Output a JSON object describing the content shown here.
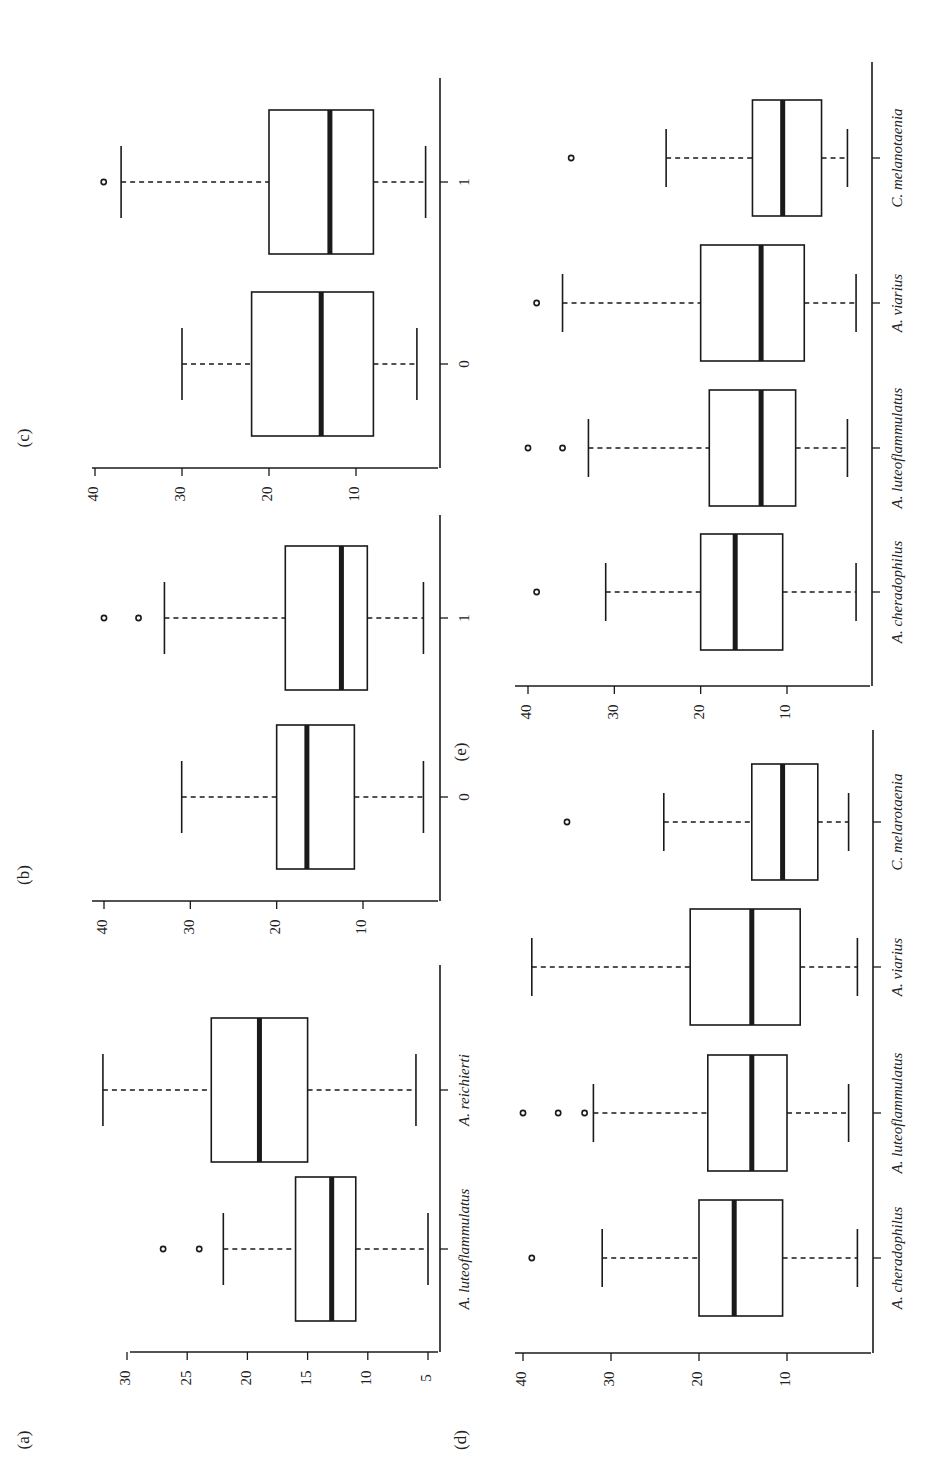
{
  "figure": {
    "orientation": "rotated-90-ccw",
    "colors": {
      "ink": "#1a1a1a",
      "background": "#ffffff"
    }
  },
  "chart_data": [
    {
      "panel": "(a)",
      "type": "box",
      "title": "",
      "xlabel": "",
      "ylabel": "",
      "yticks": [
        5,
        10,
        15,
        20,
        25,
        30
      ],
      "ylim": [
        4,
        32
      ],
      "categories": [
        "A. luteoflammulatus",
        "A. reichierti"
      ],
      "series": [
        {
          "name": "A. luteoflammulatus",
          "whisker_low": 5,
          "q1": 11,
          "median": 13,
          "q3": 16,
          "whisker_high": 22,
          "outliers": [
            24,
            27
          ]
        },
        {
          "name": "A. reichierti",
          "whisker_low": 6,
          "q1": 15,
          "median": 19,
          "q3": 23,
          "whisker_high": 32,
          "outliers": []
        }
      ]
    },
    {
      "panel": "(b)",
      "type": "box",
      "title": "",
      "xlabel": "",
      "ylabel": "",
      "yticks": [
        10,
        20,
        30,
        40
      ],
      "ylim": [
        2,
        41
      ],
      "categories": [
        "0",
        "1"
      ],
      "series": [
        {
          "name": "0",
          "whisker_low": 3,
          "q1": 11,
          "median": 16.5,
          "q3": 20,
          "whisker_high": 31,
          "outliers": []
        },
        {
          "name": "1",
          "whisker_low": 3,
          "q1": 9.5,
          "median": 12.5,
          "q3": 19,
          "whisker_high": 33,
          "outliers": [
            36,
            40
          ]
        }
      ]
    },
    {
      "panel": "(c)",
      "type": "box",
      "title": "",
      "xlabel": "",
      "ylabel": "",
      "yticks": [
        10,
        20,
        30,
        40
      ],
      "ylim": [
        1,
        41
      ],
      "categories": [
        "0",
        "1"
      ],
      "series": [
        {
          "name": "0",
          "whisker_low": 3,
          "q1": 8,
          "median": 14,
          "q3": 22,
          "whisker_high": 30,
          "outliers": []
        },
        {
          "name": "1",
          "whisker_low": 2,
          "q1": 8,
          "median": 13,
          "q3": 20,
          "whisker_high": 37,
          "outliers": [
            39
          ]
        }
      ]
    },
    {
      "panel": "(d)",
      "type": "box",
      "title": "",
      "xlabel": "",
      "ylabel": "",
      "yticks": [
        10,
        20,
        30,
        40
      ],
      "ylim": [
        1,
        41
      ],
      "categories": [
        "A. cheradophilus",
        "A. luteoflammulatus",
        "A. viarius",
        "C. melarotaenia"
      ],
      "series": [
        {
          "name": "A. cheradophilus",
          "whisker_low": 2,
          "q1": 10.5,
          "median": 16,
          "q3": 20,
          "whisker_high": 31,
          "outliers": [
            39
          ]
        },
        {
          "name": "A. luteoflammulatus",
          "whisker_low": 3,
          "q1": 10,
          "median": 14,
          "q3": 19,
          "whisker_high": 32,
          "outliers": [
            33,
            36,
            40
          ]
        },
        {
          "name": "A. viarius",
          "whisker_low": 2,
          "q1": 8.5,
          "median": 14,
          "q3": 21,
          "whisker_high": 39,
          "outliers": []
        },
        {
          "name": "C. melarotaenia",
          "whisker_low": 3,
          "q1": 6.5,
          "median": 10.5,
          "q3": 14,
          "whisker_high": 24,
          "outliers": [
            35
          ]
        }
      ]
    },
    {
      "panel": "(e)",
      "type": "box",
      "title": "",
      "xlabel": "",
      "ylabel": "",
      "yticks": [
        10,
        20,
        30,
        40
      ],
      "ylim": [
        1,
        41
      ],
      "categories": [
        "A. cheradophilus",
        "A. luteoflammulatus",
        "A. viarius",
        "C. melanotaenia"
      ],
      "series": [
        {
          "name": "A. cheradophilus",
          "whisker_low": 2,
          "q1": 10.5,
          "median": 16,
          "q3": 20,
          "whisker_high": 31,
          "outliers": [
            39
          ]
        },
        {
          "name": "A. luteoflammulatus",
          "whisker_low": 3,
          "q1": 9,
          "median": 13,
          "q3": 19,
          "whisker_high": 33,
          "outliers": [
            36,
            40
          ]
        },
        {
          "name": "A. viarius",
          "whisker_low": 2,
          "q1": 8,
          "median": 13,
          "q3": 20,
          "whisker_high": 36,
          "outliers": [
            39
          ]
        },
        {
          "name": "C. melanotaenia",
          "whisker_low": 3,
          "q1": 6,
          "median": 10.5,
          "q3": 14,
          "whisker_high": 24,
          "outliers": [
            35
          ]
        }
      ]
    }
  ]
}
